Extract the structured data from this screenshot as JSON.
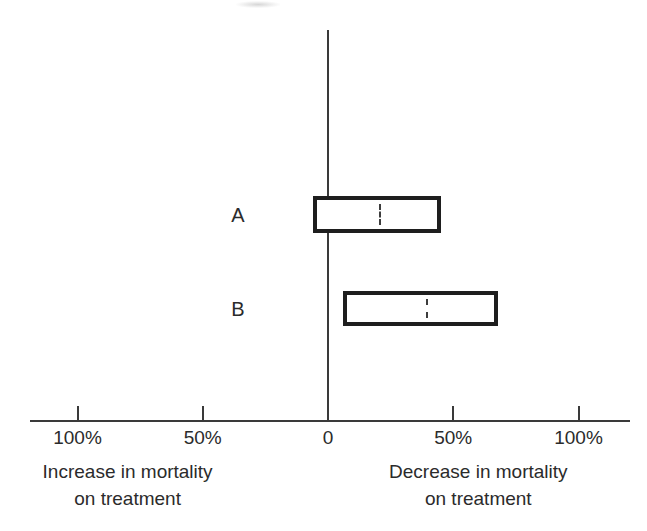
{
  "chart_data": {
    "type": "bar",
    "subtype": "confidence-interval-boxes",
    "title": "",
    "xlabel": "",
    "ylabel": "",
    "xlim": [
      -119,
      121
    ],
    "grid": false,
    "legend": null,
    "axis": {
      "ticks": [
        {
          "label": "100%",
          "value": -100
        },
        {
          "label": "50%",
          "value": -50
        },
        {
          "label": "0",
          "value": 0
        },
        {
          "label": "50%",
          "value": 50
        },
        {
          "label": "100%",
          "value": 100
        }
      ],
      "zero_reference_value": 0
    },
    "captions": [
      {
        "id": "left",
        "line1": "Increase in mortality",
        "line2": "on treatment",
        "at_value": -80
      },
      {
        "id": "right",
        "line1": "Decrease in mortality",
        "line2": "on treatment",
        "at_value": 60
      }
    ],
    "categories": [
      "A",
      "B"
    ],
    "series": [
      {
        "name": "Confidence interval",
        "items": [
          {
            "label": "A",
            "lower": -6,
            "upper": 45,
            "median": 19
          },
          {
            "label": "B",
            "lower": 6,
            "upper": 68,
            "median": 38
          }
        ]
      }
    ]
  },
  "colors": {
    "background": "#ffffff",
    "line": "#3a3a3a",
    "box_border": "#1e1e1e",
    "median": "#3d3d3d",
    "text": "#2b2b2b"
  }
}
